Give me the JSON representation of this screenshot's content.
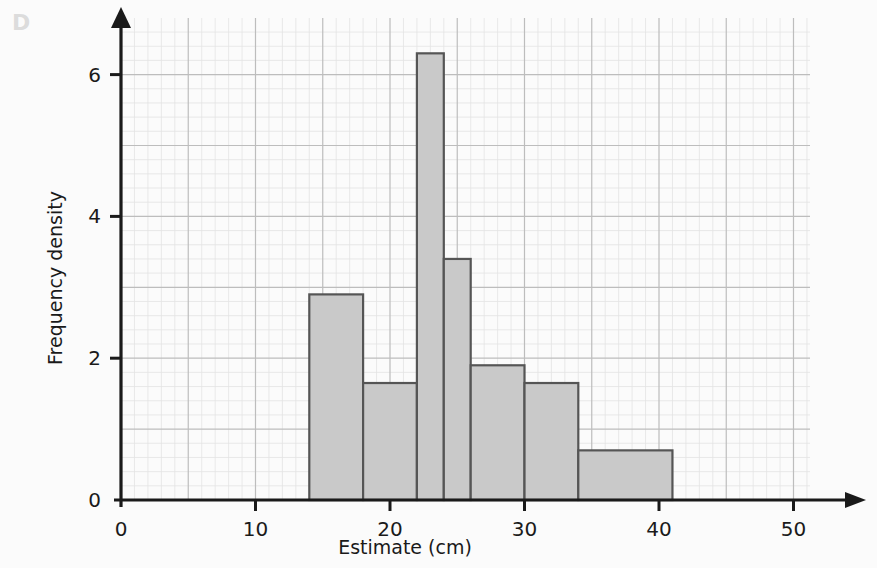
{
  "panel": {
    "label": "D"
  },
  "chart_data": {
    "type": "bar",
    "title": "",
    "subtitle": "",
    "xlabel": "Estimate (cm)",
    "ylabel": "Frequency density",
    "xlim": [
      0,
      55
    ],
    "ylim": [
      0,
      6.8
    ],
    "xticks": [
      0,
      10,
      20,
      30,
      40,
      50
    ],
    "xtick_labels": [
      "0",
      "10",
      "20",
      "30",
      "40",
      "50"
    ],
    "yticks": [
      0,
      2,
      4,
      6
    ],
    "ytick_labels": [
      "0",
      "2",
      "4",
      "6"
    ],
    "grid": true,
    "grid_major_x": 5,
    "grid_minor_x": 1,
    "grid_major_y": 1,
    "grid_minor_y": 0.2,
    "legend": null,
    "bar_fill_color": "#c9c9c9",
    "bar_edge_color": "#555555",
    "axis_color": "#1a1a1a",
    "grid_major_color": "#bdbdbd",
    "grid_minor_color": "#e3e3e3",
    "bins": [
      {
        "label": "14-18",
        "x_start": 14,
        "x_end": 18,
        "value": 2.9
      },
      {
        "label": "18-22",
        "x_start": 18,
        "x_end": 22,
        "value": 1.65
      },
      {
        "label": "22-24",
        "x_start": 22,
        "x_end": 24,
        "value": 6.3
      },
      {
        "label": "24-26",
        "x_start": 24,
        "x_end": 26,
        "value": 3.4
      },
      {
        "label": "26-30",
        "x_start": 26,
        "x_end": 30,
        "value": 1.9
      },
      {
        "label": "30-34",
        "x_start": 30,
        "x_end": 34,
        "value": 1.65
      },
      {
        "label": "34-41",
        "x_start": 34,
        "x_end": 41,
        "value": 0.7
      }
    ],
    "categories": [
      "14-18",
      "18-22",
      "22-24",
      "24-26",
      "26-30",
      "30-34",
      "34-41"
    ],
    "values": [
      2.9,
      1.65,
      6.3,
      3.4,
      1.9,
      1.65,
      0.7
    ]
  }
}
